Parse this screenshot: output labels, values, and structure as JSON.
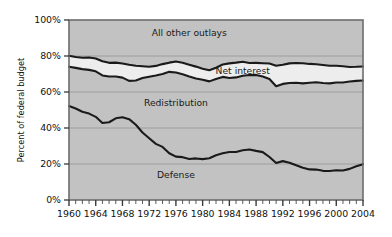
{
  "chart_data": {
    "type": "area",
    "title": "",
    "xlabel": "",
    "ylabel": "Percent of federal budget",
    "xlim": [
      1960,
      2004
    ],
    "ylim": [
      0,
      100
    ],
    "grid": true,
    "legend_position": "inline-annotations",
    "y_ticks": [
      "0%",
      "20%",
      "40%",
      "60%",
      "80%",
      "100%"
    ],
    "y_tick_values": [
      0,
      20,
      40,
      60,
      80,
      100
    ],
    "x_ticks": [
      "1960",
      "1964",
      "1968",
      "1972",
      "1976",
      "1980",
      "1984",
      "1988",
      "1992",
      "1996",
      "2000",
      "2004"
    ],
    "x_tick_values": [
      1960,
      1964,
      1968,
      1972,
      1976,
      1980,
      1984,
      1988,
      1992,
      1996,
      2000,
      2004
    ],
    "x_minor_tick_step": 1,
    "annotations": [
      {
        "text": "All other outlays",
        "x": 1978,
        "y": 91
      },
      {
        "text": "Net interest",
        "x": 1986,
        "y": 70
      },
      {
        "text": "Redistribution",
        "x": 1976,
        "y": 52
      },
      {
        "text": "Defense",
        "x": 1976,
        "y": 12
      }
    ],
    "x": [
      1960,
      1961,
      1962,
      1963,
      1964,
      1965,
      1966,
      1967,
      1968,
      1969,
      1970,
      1971,
      1972,
      1973,
      1974,
      1975,
      1976,
      1977,
      1978,
      1979,
      1980,
      1981,
      1982,
      1983,
      1984,
      1985,
      1986,
      1987,
      1988,
      1989,
      1990,
      1991,
      1992,
      1993,
      1994,
      1995,
      1996,
      1997,
      1998,
      1999,
      2000,
      2001,
      2002,
      2003,
      2004
    ],
    "series": [
      {
        "name": "Defense",
        "description": "Cumulative lower band: defense share of federal budget",
        "values": [
          52.2,
          50.8,
          49.0,
          48.0,
          46.2,
          42.8,
          43.2,
          45.4,
          46.0,
          44.9,
          41.8,
          37.5,
          34.3,
          31.2,
          29.5,
          26.0,
          24.1,
          23.8,
          22.8,
          23.1,
          22.7,
          23.2,
          24.9,
          26.0,
          26.7,
          26.7,
          27.6,
          28.1,
          27.3,
          26.6,
          23.9,
          20.6,
          21.6,
          20.7,
          19.3,
          17.9,
          17.0,
          16.9,
          16.2,
          16.1,
          16.5,
          16.4,
          17.3,
          18.8,
          19.9
        ]
      },
      {
        "name": "Redistribution",
        "description": "Cumulative boundary: defense + redistribution share",
        "values": [
          74.0,
          73.4,
          72.7,
          72.3,
          71.5,
          69.2,
          68.6,
          68.6,
          68.0,
          66.2,
          66.4,
          67.8,
          68.5,
          69.2,
          70.0,
          71.2,
          70.8,
          69.8,
          68.6,
          67.5,
          66.8,
          65.9,
          67.2,
          68.4,
          67.8,
          68.1,
          69.0,
          69.4,
          69.5,
          68.6,
          67.2,
          63.2,
          64.5,
          65.0,
          65.1,
          64.8,
          65.1,
          65.4,
          65.0,
          64.8,
          65.3,
          65.3,
          65.8,
          66.2,
          66.4
        ]
      },
      {
        "name": "Net interest",
        "description": "Cumulative boundary: defense + redistribution + net interest share",
        "values": [
          80.1,
          79.4,
          79.0,
          79.2,
          78.6,
          77.1,
          76.2,
          76.3,
          75.8,
          75.1,
          74.6,
          74.3,
          74.0,
          74.5,
          75.5,
          76.3,
          76.9,
          76.2,
          75.2,
          74.1,
          72.9,
          72.1,
          73.5,
          75.3,
          75.9,
          76.3,
          76.8,
          76.1,
          76.2,
          76.0,
          75.8,
          74.6,
          75.1,
          75.9,
          76.1,
          76.0,
          75.6,
          75.4,
          75.0,
          74.6,
          74.6,
          74.3,
          73.9,
          74.0,
          74.2
        ]
      },
      {
        "name": "All other outlays",
        "description": "Remaining share up to 100%",
        "values": [
          19.9,
          20.6,
          21.0,
          20.8,
          21.4,
          22.9,
          23.8,
          23.7,
          24.2,
          24.9,
          25.4,
          25.7,
          26.0,
          25.5,
          24.5,
          23.7,
          23.1,
          23.8,
          24.8,
          25.9,
          27.1,
          27.9,
          26.5,
          24.7,
          24.1,
          23.7,
          23.2,
          23.9,
          23.8,
          24.0,
          24.2,
          25.4,
          24.9,
          24.1,
          23.9,
          24.0,
          24.4,
          24.6,
          25.0,
          25.4,
          25.4,
          25.7,
          26.1,
          26.0,
          25.8
        ]
      }
    ],
    "colors": {
      "band_fill": "#c2c2c2",
      "net_interest_fill": "#ededed",
      "line": "#1a1a1a",
      "grid": "#9a9a9a",
      "frame": "#6d6d6d",
      "background": "#ffffff"
    }
  }
}
